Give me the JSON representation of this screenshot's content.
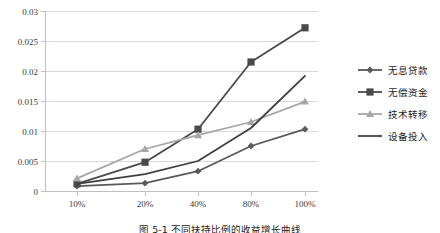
{
  "chart_data": {
    "type": "line",
    "title": "",
    "xlabel": "",
    "ylabel": "",
    "categories": [
      "10%",
      "20%",
      "40%",
      "80%",
      "100%"
    ],
    "ylim": [
      0,
      0.03
    ],
    "yticks": [
      "0",
      "0.005",
      "0.01",
      "0.015",
      "0.02",
      "0.025",
      "0.03"
    ],
    "ytick_values": [
      0,
      0.005,
      0.01,
      0.015,
      0.02,
      0.025,
      0.03
    ],
    "grid": "horizontal",
    "legend_position": "right",
    "series": [
      {
        "name": "无息贷款",
        "marker": "diamond",
        "color": "#595959",
        "values": [
          0.0008,
          0.0013,
          0.0033,
          0.0075,
          0.0103
        ]
      },
      {
        "name": "无偿资金",
        "marker": "square",
        "color": "#4a4a4a",
        "values": [
          0.0012,
          0.0048,
          0.0103,
          0.0215,
          0.0272
        ]
      },
      {
        "name": "技术转移",
        "marker": "triangle",
        "color": "#a6a6a6",
        "values": [
          0.0021,
          0.007,
          0.0093,
          0.0115,
          0.0149
        ]
      },
      {
        "name": "设备投入",
        "marker": "none",
        "color": "#404040",
        "values": [
          0.0012,
          0.0028,
          0.005,
          0.0105,
          0.0192
        ]
      }
    ]
  },
  "caption": {
    "text": "图 5-1 不同扶持比例的收益增长曲线"
  },
  "axis": {
    "y_axis_name": "value-axis",
    "x_axis_name": "category-axis"
  }
}
